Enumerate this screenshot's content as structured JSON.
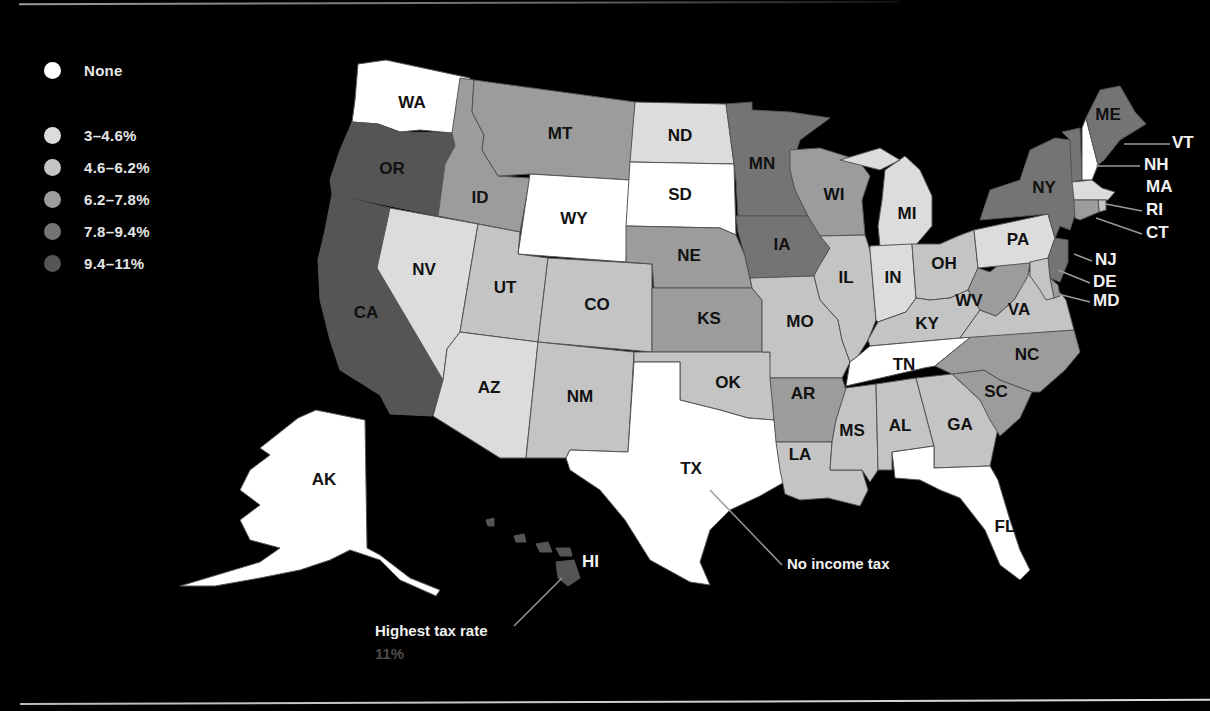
{
  "legend": {
    "items": [
      {
        "label": "None",
        "color": "#ffffff"
      },
      {
        "label": "3–4.6%",
        "color": "#dcdcdc"
      },
      {
        "label": "4.6–6.2%",
        "color": "#c4c4c4"
      },
      {
        "label": "6.2–7.8%",
        "color": "#9c9c9c"
      },
      {
        "label": "7.8–9.4%",
        "color": "#747474"
      },
      {
        "label": "9.4–11%",
        "color": "#555555"
      }
    ]
  },
  "annotations": {
    "no_income_tax": "No income tax",
    "highest_label": "Highest tax rate",
    "highest_value": "11%"
  },
  "states": {
    "WA": {
      "label": "WA",
      "bracket": "None"
    },
    "OR": {
      "label": "OR",
      "bracket": "9.4–11%"
    },
    "CA": {
      "label": "CA",
      "bracket": "9.4–11%"
    },
    "ID": {
      "label": "ID",
      "bracket": "6.2–7.8%"
    },
    "MT": {
      "label": "MT",
      "bracket": "6.2–7.8%"
    },
    "WY": {
      "label": "WY",
      "bracket": "None"
    },
    "NV": {
      "label": "NV",
      "bracket": "None"
    },
    "UT": {
      "label": "UT",
      "bracket": "4.6–6.2%"
    },
    "CO": {
      "label": "CO",
      "bracket": "4.6–6.2%"
    },
    "AZ": {
      "label": "AZ",
      "bracket": "3–4.6%"
    },
    "NM": {
      "label": "NM",
      "bracket": "4.6–6.2%"
    },
    "ND": {
      "label": "ND",
      "bracket": "3–4.6%"
    },
    "SD": {
      "label": "SD",
      "bracket": "None"
    },
    "NE": {
      "label": "NE",
      "bracket": "6.2–7.8%"
    },
    "KS": {
      "label": "KS",
      "bracket": "6.2–7.8%"
    },
    "OK": {
      "label": "OK",
      "bracket": "4.6–6.2%"
    },
    "TX": {
      "label": "TX",
      "bracket": "None"
    },
    "MN": {
      "label": "MN",
      "bracket": "7.8–9.4%"
    },
    "IA": {
      "label": "IA",
      "bracket": "7.8–9.4%"
    },
    "MO": {
      "label": "MO",
      "bracket": "4.6–6.2%"
    },
    "AR": {
      "label": "AR",
      "bracket": "6.2–7.8%"
    },
    "LA": {
      "label": "LA",
      "bracket": "4.6–6.2%"
    },
    "WI": {
      "label": "WI",
      "bracket": "6.2–7.8%"
    },
    "IL": {
      "label": "IL",
      "bracket": "4.6–6.2%"
    },
    "MI": {
      "label": "MI",
      "bracket": "3–4.6%"
    },
    "IN": {
      "label": "IN",
      "bracket": "3–4.6%"
    },
    "OH": {
      "label": "OH",
      "bracket": "4.6–6.2%"
    },
    "KY": {
      "label": "KY",
      "bracket": "4.6–6.2%"
    },
    "TN": {
      "label": "TN",
      "bracket": "None"
    },
    "MS": {
      "label": "MS",
      "bracket": "4.6–6.2%"
    },
    "AL": {
      "label": "AL",
      "bracket": "4.6–6.2%"
    },
    "GA": {
      "label": "GA",
      "bracket": "4.6–6.2%"
    },
    "FL": {
      "label": "FL",
      "bracket": "None"
    },
    "SC": {
      "label": "SC",
      "bracket": "6.2–7.8%"
    },
    "NC": {
      "label": "NC",
      "bracket": "6.2–7.8%"
    },
    "VA": {
      "label": "VA",
      "bracket": "4.6–6.2%"
    },
    "WV": {
      "label": "WV",
      "bracket": "6.2–7.8%"
    },
    "PA": {
      "label": "PA",
      "bracket": "3–4.6%"
    },
    "NY": {
      "label": "NY",
      "bracket": "7.8–9.4%"
    },
    "NJ": {
      "label": "NJ",
      "bracket": "7.8–9.4%"
    },
    "DE": {
      "label": "DE",
      "bracket": "6.2–7.8%"
    },
    "MD": {
      "label": "MD",
      "bracket": "4.6–6.2%"
    },
    "VT": {
      "label": "VT",
      "bracket": "7.8–9.4%"
    },
    "NH": {
      "label": "NH",
      "bracket": "None"
    },
    "MA": {
      "label": "MA",
      "bracket": "4.6–6.2%"
    },
    "RI": {
      "label": "RI",
      "bracket": "4.6–6.2%"
    },
    "CT": {
      "label": "CT",
      "bracket": "6.2–7.8%"
    },
    "ME": {
      "label": "ME",
      "bracket": "7.8–9.4%"
    },
    "AK": {
      "label": "AK",
      "bracket": "None"
    },
    "HI": {
      "label": "HI",
      "bracket": "9.4–11%"
    }
  }
}
